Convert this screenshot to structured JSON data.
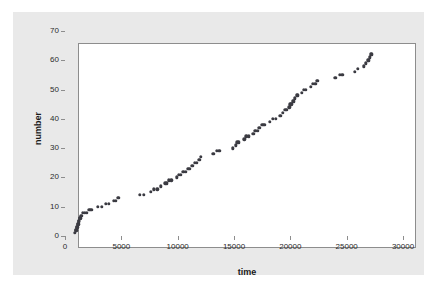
{
  "figure": {
    "background_color": "#ffffff",
    "panel_color": "#e9e9e9",
    "plot_background_color": "#ffffff",
    "frame_color": "#8d8d8d",
    "point_color": "#3b3b42"
  },
  "chart_data": {
    "type": "scatter",
    "title": "",
    "xlabel": "time",
    "ylabel": "number",
    "xlim": [
      0,
      30000
    ],
    "ylim": [
      0,
      70
    ],
    "xticks": [
      0,
      5000,
      10000,
      15000,
      20000,
      25000,
      30000
    ],
    "yticks": [
      0,
      10,
      20,
      30,
      40,
      50,
      60,
      70
    ],
    "xtick_labels": [
      "0",
      "5000",
      "10000",
      "15000",
      "20000",
      "25000",
      "30000"
    ],
    "ytick_labels": [
      "0",
      "10",
      "20",
      "30",
      "40",
      "50",
      "60",
      "70"
    ],
    "grid": false,
    "legend": false,
    "marker": "circle",
    "series": [
      {
        "name": "number",
        "points": [
          [
            880,
            1
          ],
          [
            950,
            2
          ],
          [
            1000,
            2
          ],
          [
            1040,
            3
          ],
          [
            1080,
            3
          ],
          [
            1120,
            4
          ],
          [
            1170,
            4
          ],
          [
            1200,
            5
          ],
          [
            1250,
            5
          ],
          [
            1300,
            6
          ],
          [
            1350,
            6
          ],
          [
            1420,
            7
          ],
          [
            1500,
            7
          ],
          [
            1600,
            8
          ],
          [
            1750,
            8
          ],
          [
            1950,
            8
          ],
          [
            2150,
            9
          ],
          [
            2350,
            9
          ],
          [
            2900,
            10
          ],
          [
            3250,
            10
          ],
          [
            3600,
            11
          ],
          [
            3900,
            11
          ],
          [
            4350,
            12
          ],
          [
            4500,
            12
          ],
          [
            4700,
            13
          ],
          [
            4800,
            13
          ],
          [
            6650,
            14
          ],
          [
            7000,
            14
          ],
          [
            7600,
            15
          ],
          [
            7900,
            16
          ],
          [
            8200,
            16
          ],
          [
            8500,
            17
          ],
          [
            8900,
            18
          ],
          [
            9050,
            18
          ],
          [
            9200,
            19
          ],
          [
            9450,
            19
          ],
          [
            9900,
            20
          ],
          [
            10100,
            21
          ],
          [
            10300,
            21
          ],
          [
            10500,
            22
          ],
          [
            10700,
            22
          ],
          [
            10900,
            23
          ],
          [
            11050,
            23
          ],
          [
            11300,
            24
          ],
          [
            11500,
            25
          ],
          [
            11700,
            25
          ],
          [
            11850,
            26
          ],
          [
            11950,
            26
          ],
          [
            12050,
            27
          ],
          [
            13150,
            28
          ],
          [
            13500,
            29
          ],
          [
            13700,
            29
          ],
          [
            14900,
            30
          ],
          [
            15150,
            31
          ],
          [
            15300,
            32
          ],
          [
            15450,
            32
          ],
          [
            15900,
            33
          ],
          [
            16100,
            34
          ],
          [
            16300,
            34
          ],
          [
            16700,
            35
          ],
          [
            16900,
            36
          ],
          [
            17100,
            36
          ],
          [
            17250,
            37
          ],
          [
            17500,
            38
          ],
          [
            17700,
            38
          ],
          [
            18200,
            39
          ],
          [
            18450,
            40
          ],
          [
            18700,
            40
          ],
          [
            19100,
            41
          ],
          [
            19350,
            42
          ],
          [
            19550,
            43
          ],
          [
            19700,
            43
          ],
          [
            19900,
            44
          ],
          [
            20000,
            45
          ],
          [
            20100,
            45
          ],
          [
            20200,
            46
          ],
          [
            20300,
            46
          ],
          [
            20400,
            47
          ],
          [
            20550,
            48
          ],
          [
            20650,
            48
          ],
          [
            21000,
            49
          ],
          [
            21200,
            50
          ],
          [
            21350,
            50
          ],
          [
            21800,
            51
          ],
          [
            22000,
            52
          ],
          [
            22200,
            52
          ],
          [
            22350,
            53
          ],
          [
            22450,
            53
          ],
          [
            24000,
            54
          ],
          [
            24400,
            55
          ],
          [
            24600,
            55
          ],
          [
            25700,
            56
          ],
          [
            26000,
            57
          ],
          [
            26500,
            58
          ],
          [
            26700,
            59
          ],
          [
            26850,
            60
          ],
          [
            26950,
            60
          ],
          [
            27050,
            61
          ],
          [
            27150,
            62
          ],
          [
            27220,
            62
          ]
        ]
      }
    ]
  }
}
